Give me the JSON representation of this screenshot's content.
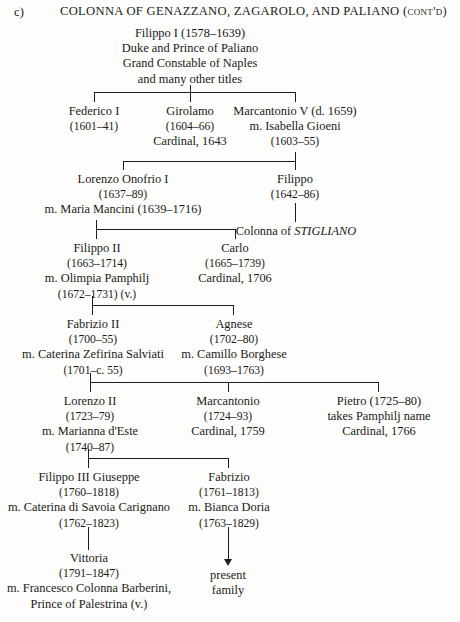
{
  "header": {
    "section_label": "c)",
    "title": "COLONNA OF GENAZZANO, ZAGAROLO, AND PALIANO (cont'd)"
  },
  "nodes": {
    "filippo_i": {
      "name": "Filippo I (1578–1639)",
      "line2": "Duke and Prince of Paliano",
      "line3": "Grand Constable of Naples",
      "line4": "and many other titles"
    },
    "federico_i": {
      "name": "Federico I",
      "dates": "(1601–41)"
    },
    "girolamo": {
      "name": "Girolamo",
      "dates": "(1604–66)",
      "title": "Cardinal, 1643"
    },
    "marcantonio_v": {
      "name": "Marcantonio V (d. 1659)",
      "spouse": "m. Isabella Gioeni",
      "dates": "(1603–55)"
    },
    "lorenzo_onofrio_i": {
      "name": "Lorenzo Onofrio I",
      "dates": "(1637–89)",
      "spouse": "m. Maria Mancini (1639–1716)"
    },
    "filippo_stigliano": {
      "name": "Filippo",
      "dates": "(1642–86)",
      "branch": "Colonna of STIGLIANO",
      "branch_prefix": "Colonna of ",
      "branch_caps": "STIGLIANO"
    },
    "filippo_ii": {
      "name": "Filippo II",
      "dates": "(1663–1714)",
      "spouse": "m. Olimpia Pamphilj",
      "spouse_dates": "(1672–1731) (v.)"
    },
    "carlo": {
      "name": "Carlo",
      "dates": "(1665–1739)",
      "title": "Cardinal, 1706"
    },
    "fabrizio_ii": {
      "name": "Fabrizio II",
      "dates": "(1700–55)",
      "spouse": "m. Caterina Zefirina Salviati",
      "spouse_dates": "(1701–c. 55)"
    },
    "agnese": {
      "name": "Agnese",
      "dates": "(1702–80)",
      "spouse": "m. Camillo Borghese",
      "spouse_dates": "(1693–1763)"
    },
    "lorenzo_ii": {
      "name": "Lorenzo II",
      "dates": "(1723–79)",
      "spouse": "m. Marianna d'Este",
      "spouse_dates": "(1740–87)"
    },
    "marcantonio": {
      "name": "Marcantonio",
      "dates": "(1724–93)",
      "title": "Cardinal, 1759"
    },
    "pietro": {
      "name": "Pietro (1725–80)",
      "note": "takes Pamphilj name",
      "title": "Cardinal, 1766"
    },
    "filippo_iii_giuseppe": {
      "name": "Filippo III Giuseppe",
      "dates": "(1760–1818)",
      "spouse": "m. Caterina di Savoia Carignano",
      "spouse_dates": "(1762–1823)"
    },
    "fabrizio": {
      "name": "Fabrizio",
      "dates": "(1761–1813)",
      "spouse": "m. Bianca Doria",
      "spouse_dates": "(1763–1829)"
    },
    "vittoria": {
      "name": "Vittoria",
      "dates": "(1791–1847)",
      "spouse": "m. Francesco Colonna Barberini,",
      "spouse_title": "Prince of Palestrina (v.)"
    },
    "present_family": {
      "line1": "present",
      "line2": "family"
    }
  }
}
